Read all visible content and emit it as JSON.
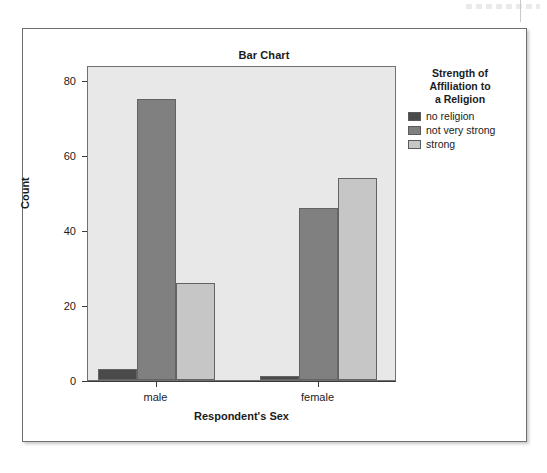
{
  "figure": {
    "title": "Bar Chart"
  },
  "legend": {
    "title_lines": [
      "Strength of",
      "Affiliation to",
      "a Religion"
    ],
    "items": [
      {
        "label": "no religion",
        "color": "#4a4a4a"
      },
      {
        "label": "not very strong",
        "color": "#808080"
      },
      {
        "label": "strong",
        "color": "#c6c6c6"
      }
    ]
  },
  "axes": {
    "y_ticks": [
      "0",
      "20",
      "40",
      "60",
      "80"
    ],
    "x_ticks": [
      "male",
      "female"
    ]
  },
  "chart_data": {
    "type": "bar",
    "title": "Bar Chart",
    "xlabel": "Respondent's Sex",
    "ylabel": "Count",
    "categories": [
      "male",
      "female"
    ],
    "series": [
      {
        "name": "no religion",
        "values": [
          3,
          1
        ],
        "color": "#4a4a4a"
      },
      {
        "name": "not very strong",
        "values": [
          75,
          46
        ],
        "color": "#808080"
      },
      {
        "name": "strong",
        "values": [
          26,
          54
        ],
        "color": "#c6c6c6"
      }
    ],
    "ylim": [
      0,
      84
    ],
    "yticks": [
      0,
      20,
      40,
      60,
      80
    ],
    "grid": false,
    "legend_position": "right",
    "legend_title": "Strength of Affiliation to a Religion",
    "plot_background": "#e8e8e8",
    "grouping": "grouped"
  }
}
